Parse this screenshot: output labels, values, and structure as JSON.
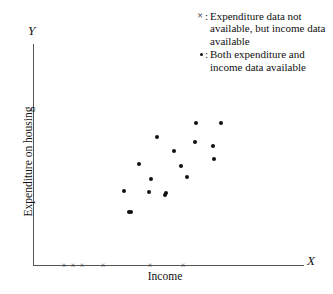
{
  "figure": {
    "axis_letter_y": "Y",
    "axis_letter_x": "X",
    "axis_title_y": "Expenditure on housing",
    "axis_title_x": "Income",
    "marker_color": "#111111",
    "axis_color": "#555555",
    "background": "#ffffff"
  },
  "legend": {
    "entries": [
      {
        "key": "x",
        "colon": ":",
        "text": "Expenditure data not available, but income data available"
      },
      {
        "key": "dot",
        "colon": ":",
        "text": "Both expenditure and income data available"
      }
    ]
  },
  "chart_data": {
    "type": "scatter",
    "title": "",
    "xlabel": "Income",
    "ylabel": "Expenditure on housing",
    "xlim": [
      0,
      100
    ],
    "ylim": [
      0,
      100
    ],
    "grid": false,
    "legend_position": "top-right",
    "axis_ticks": "none",
    "series": [
      {
        "name": "Both expenditure and income data available",
        "marker": "dot",
        "count": 17,
        "points_px": [
          [
            196,
            123
          ],
          [
            221,
            123
          ],
          [
            157,
            137
          ],
          [
            195,
            142
          ],
          [
            213,
            146
          ],
          [
            174,
            151
          ],
          [
            181,
            166
          ],
          [
            214,
            159
          ],
          [
            139,
            164
          ],
          [
            151,
            179
          ],
          [
            187,
            177
          ],
          [
            124,
            191
          ],
          [
            149,
            192
          ],
          [
            166,
            193
          ],
          [
            165,
            195
          ],
          [
            131,
            212
          ],
          [
            129,
            212
          ]
        ],
        "points_data": [
          [
            60,
            65
          ],
          [
            70,
            65
          ],
          [
            46,
            58
          ],
          [
            60,
            56
          ],
          [
            67,
            54
          ],
          [
            52,
            52
          ],
          [
            55,
            45
          ],
          [
            67,
            48
          ],
          [
            39,
            46
          ],
          [
            44,
            39
          ],
          [
            57,
            40
          ],
          [
            34,
            34
          ],
          [
            43,
            34
          ],
          [
            49,
            33
          ],
          [
            49,
            32
          ],
          [
            36,
            24
          ],
          [
            36,
            24
          ]
        ]
      },
      {
        "name": "Expenditure data not available, but income data available",
        "marker": "cross",
        "count": 6,
        "points_px": [
          [
            64,
            265
          ],
          [
            73,
            265
          ],
          [
            82,
            265
          ],
          [
            103,
            265
          ],
          [
            150,
            265
          ],
          [
            183,
            265
          ]
        ],
        "points_data": [
          [
            11,
            0
          ],
          [
            15,
            0
          ],
          [
            18,
            0
          ],
          [
            26,
            0
          ],
          [
            43,
            0
          ],
          [
            55,
            0
          ]
        ]
      }
    ]
  }
}
